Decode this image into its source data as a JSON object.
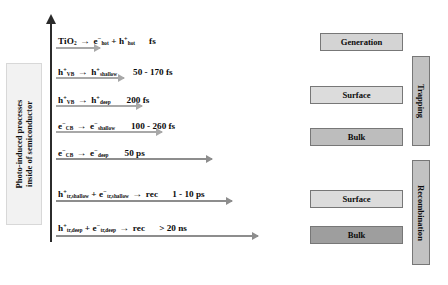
{
  "figure": {
    "side_caption_line1": "Photo-induced processes",
    "side_caption_line2": "inside of semiconductor"
  },
  "processes": [
    {
      "reactant": "TiO",
      "reactant_sub": "2",
      "product_left": "e",
      "product_left_sup": "−",
      "product_left_sub": "hot",
      "plus": "+",
      "product_right": "h",
      "product_right_sup": "+",
      "product_right_sub": "hot",
      "arrow": "→",
      "time": "fs"
    },
    {
      "reactant": "h",
      "reactant_sup": "+",
      "reactant_sub": "VB",
      "product_left": "h",
      "product_left_sup": "+",
      "product_left_sub": "shallow",
      "arrow": "→",
      "time": "50 - 170 fs"
    },
    {
      "reactant": "h",
      "reactant_sup": "+",
      "reactant_sub": "VB",
      "product_left": "h",
      "product_left_sup": "+",
      "product_left_sub": "deep",
      "arrow": "→",
      "time": "200 fs"
    },
    {
      "reactant": "e",
      "reactant_sup": "−",
      "reactant_sub": "CB",
      "product_left": "e",
      "product_left_sup": "−",
      "product_left_sub": "shallow",
      "arrow": "→",
      "time": "100 - 260 fs"
    },
    {
      "reactant": "e",
      "reactant_sup": "−",
      "reactant_sub": "CB",
      "product_left": "e",
      "product_left_sup": "−",
      "product_left_sub": "deep",
      "arrow": "→",
      "time": "50 ps"
    },
    {
      "reactant": "h",
      "reactant_sup": "+",
      "reactant_sub": "tr,shallow",
      "plus": "+",
      "second": "e",
      "second_sup": "−",
      "second_sub": "tr,shallow",
      "product_left": "rec",
      "arrow": "→",
      "time": "1 - 10 ps"
    },
    {
      "reactant": "h",
      "reactant_sup": "+",
      "reactant_sub": "tr,deep",
      "plus": "+",
      "second": "e",
      "second_sup": "−",
      "second_sub": "tr,deep",
      "product_left": "rec",
      "arrow": "→",
      "time": "> 20 ns"
    }
  ],
  "blocks": {
    "generation": "Generation",
    "trapping_surface": "Surface",
    "trapping_bulk": "Bulk",
    "recombination_surface": "Surface",
    "recombination_bulk": "Bulk"
  },
  "bars": {
    "trapping": "Trapping",
    "recombination": "Recombination"
  },
  "colors": {
    "axis": "#2b2b2b",
    "process_arrow": "#a8a8a8",
    "block_light": "#d4d4d4",
    "block_mid": "#bdbdbd",
    "block_dark": "#9e9e9e",
    "bar": "#c2c2c2",
    "caption_bg": "#f2f2f2"
  }
}
